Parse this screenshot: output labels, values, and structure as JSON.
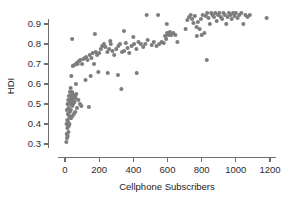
{
  "chart_data": {
    "type": "scatter",
    "title": "",
    "xlabel": "Cellphone Subscribers",
    "ylabel": "HDI",
    "xlim": [
      -40,
      1240
    ],
    "ylim": [
      0.28,
      0.975
    ],
    "grid": false,
    "legend": null,
    "marker": {
      "shape": "circle",
      "color": "#7d7d7d",
      "size_px": 3.1
    },
    "xticks": [
      0,
      200,
      400,
      600,
      800,
      1000,
      1200
    ],
    "xtick_labels": [
      "0",
      "200",
      "400",
      "600",
      "800",
      "1000",
      "1200"
    ],
    "yticks": [
      0.3,
      0.4,
      0.5,
      0.6,
      0.7,
      0.8,
      0.9
    ],
    "ytick_labels": [
      "0.3",
      "0.4",
      "0.5",
      "0.6",
      "0.7",
      "0.8",
      "0.9"
    ],
    "points": [
      [
        8,
        0.31
      ],
      [
        12,
        0.33
      ],
      [
        10,
        0.35
      ],
      [
        16,
        0.34
      ],
      [
        20,
        0.36
      ],
      [
        14,
        0.38
      ],
      [
        22,
        0.39
      ],
      [
        9,
        0.4
      ],
      [
        18,
        0.41
      ],
      [
        26,
        0.4
      ],
      [
        13,
        0.42
      ],
      [
        30,
        0.43
      ],
      [
        24,
        0.44
      ],
      [
        36,
        0.43
      ],
      [
        17,
        0.45
      ],
      [
        44,
        0.44
      ],
      [
        28,
        0.46
      ],
      [
        52,
        0.45
      ],
      [
        11,
        0.47
      ],
      [
        34,
        0.47
      ],
      [
        60,
        0.46
      ],
      [
        21,
        0.48
      ],
      [
        42,
        0.49
      ],
      [
        70,
        0.48
      ],
      [
        15,
        0.5
      ],
      [
        27,
        0.5
      ],
      [
        38,
        0.51
      ],
      [
        48,
        0.5
      ],
      [
        56,
        0.51
      ],
      [
        19,
        0.52
      ],
      [
        31,
        0.52
      ],
      [
        40,
        0.53
      ],
      [
        50,
        0.52
      ],
      [
        62,
        0.53
      ],
      [
        23,
        0.54
      ],
      [
        35,
        0.54
      ],
      [
        45,
        0.55
      ],
      [
        57,
        0.54
      ],
      [
        29,
        0.56
      ],
      [
        41,
        0.56
      ],
      [
        66,
        0.55
      ],
      [
        78,
        0.52
      ],
      [
        88,
        0.5
      ],
      [
        96,
        0.49
      ],
      [
        140,
        0.485
      ],
      [
        33,
        0.58
      ],
      [
        64,
        0.6
      ],
      [
        120,
        0.62
      ],
      [
        150,
        0.64
      ],
      [
        195,
        0.66
      ],
      [
        250,
        0.655
      ],
      [
        310,
        0.645
      ],
      [
        330,
        0.575
      ],
      [
        420,
        0.655
      ],
      [
        37,
        0.64
      ],
      [
        46,
        0.69
      ],
      [
        55,
        0.695
      ],
      [
        68,
        0.705
      ],
      [
        74,
        0.7
      ],
      [
        82,
        0.715
      ],
      [
        90,
        0.72
      ],
      [
        100,
        0.7
      ],
      [
        108,
        0.725
      ],
      [
        116,
        0.73
      ],
      [
        124,
        0.735
      ],
      [
        132,
        0.72
      ],
      [
        145,
        0.745
      ],
      [
        155,
        0.73
      ],
      [
        162,
        0.755
      ],
      [
        170,
        0.7
      ],
      [
        180,
        0.76
      ],
      [
        188,
        0.745
      ],
      [
        200,
        0.755
      ],
      [
        210,
        0.775
      ],
      [
        218,
        0.79
      ],
      [
        228,
        0.8
      ],
      [
        236,
        0.785
      ],
      [
        248,
        0.76
      ],
      [
        258,
        0.775
      ],
      [
        268,
        0.8
      ],
      [
        278,
        0.765
      ],
      [
        288,
        0.745
      ],
      [
        300,
        0.775
      ],
      [
        312,
        0.79
      ],
      [
        322,
        0.8
      ],
      [
        334,
        0.76
      ],
      [
        346,
        0.765
      ],
      [
        356,
        0.805
      ],
      [
        366,
        0.78
      ],
      [
        376,
        0.755
      ],
      [
        390,
        0.79
      ],
      [
        404,
        0.8
      ],
      [
        418,
        0.775
      ],
      [
        430,
        0.81
      ],
      [
        444,
        0.8
      ],
      [
        458,
        0.785
      ],
      [
        470,
        0.8
      ],
      [
        484,
        0.82
      ],
      [
        42,
        0.825
      ],
      [
        175,
        0.85
      ],
      [
        265,
        0.815
      ],
      [
        345,
        0.865
      ],
      [
        400,
        0.835
      ],
      [
        478,
        0.945
      ],
      [
        545,
        0.945
      ],
      [
        508,
        0.795
      ],
      [
        520,
        0.81
      ],
      [
        536,
        0.79
      ],
      [
        552,
        0.8
      ],
      [
        566,
        0.81
      ],
      [
        578,
        0.805
      ],
      [
        586,
        0.84
      ],
      [
        592,
        0.825
      ],
      [
        598,
        0.855
      ],
      [
        606,
        0.845
      ],
      [
        614,
        0.86
      ],
      [
        622,
        0.845
      ],
      [
        634,
        0.855
      ],
      [
        646,
        0.845
      ],
      [
        658,
        0.81
      ],
      [
        596,
        0.9
      ],
      [
        706,
        0.875
      ],
      [
        716,
        0.92
      ],
      [
        726,
        0.935
      ],
      [
        736,
        0.945
      ],
      [
        744,
        0.925
      ],
      [
        752,
        0.905
      ],
      [
        760,
        0.94
      ],
      [
        770,
        0.885
      ],
      [
        778,
        0.91
      ],
      [
        788,
        0.875
      ],
      [
        796,
        0.925
      ],
      [
        806,
        0.945
      ],
      [
        816,
        0.855
      ],
      [
        824,
        0.94
      ],
      [
        832,
        0.955
      ],
      [
        840,
        0.93
      ],
      [
        848,
        0.9
      ],
      [
        856,
        0.955
      ],
      [
        864,
        0.945
      ],
      [
        872,
        0.935
      ],
      [
        880,
        0.955
      ],
      [
        888,
        0.915
      ],
      [
        896,
        0.945
      ],
      [
        904,
        0.955
      ],
      [
        912,
        0.935
      ],
      [
        920,
        0.925
      ],
      [
        928,
        0.955
      ],
      [
        936,
        0.945
      ],
      [
        944,
        0.9
      ],
      [
        952,
        0.935
      ],
      [
        960,
        0.955
      ],
      [
        968,
        0.945
      ],
      [
        976,
        0.925
      ],
      [
        984,
        0.955
      ],
      [
        992,
        0.94
      ],
      [
        1000,
        0.955
      ],
      [
        1010,
        0.93
      ],
      [
        1020,
        0.945
      ],
      [
        1032,
        0.955
      ],
      [
        1044,
        0.9
      ],
      [
        1056,
        0.945
      ],
      [
        1068,
        0.935
      ],
      [
        1082,
        0.945
      ],
      [
        772,
        0.84
      ],
      [
        800,
        0.845
      ],
      [
        830,
        0.72
      ],
      [
        1180,
        0.93
      ]
    ]
  }
}
